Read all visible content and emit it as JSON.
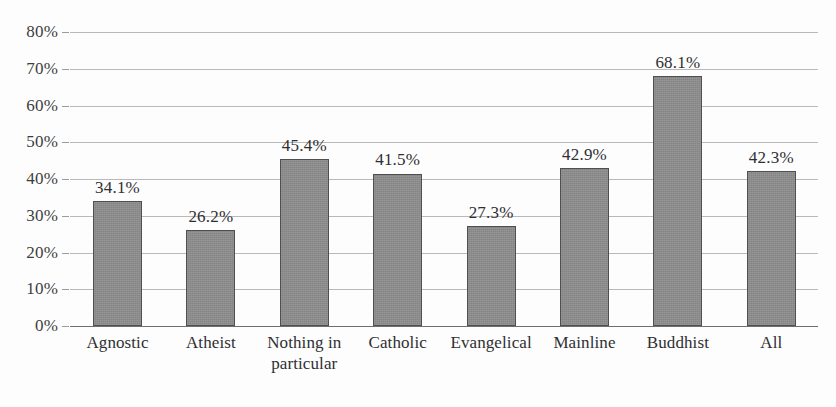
{
  "figure": {
    "background_color": "#fdfdfd",
    "title_fragment": "",
    "bar_color": "#8d8d8d",
    "bar_edge_color": "#4f4f51",
    "gridline_color": "#b9b9bb",
    "axis_color": "#6f6f71",
    "text_color": "#2f2f32"
  },
  "chart_data": {
    "type": "bar",
    "title": "",
    "xlabel": "",
    "ylabel": "",
    "ylim": [
      0,
      80
    ],
    "ytick_labels": [
      "80%",
      "70%",
      "60%",
      "50%",
      "40%",
      "30%",
      "20%",
      "10%",
      "0%"
    ],
    "ytick_values": [
      80,
      70,
      60,
      50,
      40,
      30,
      20,
      10,
      0
    ],
    "grid": true,
    "legend": false,
    "categories": [
      "Agnostic",
      "Atheist",
      "Nothing in particular",
      "Catholic",
      "Evangelical",
      "Mainline",
      "Buddhist",
      "All"
    ],
    "values": [
      34.1,
      26.2,
      45.4,
      41.5,
      27.3,
      42.9,
      68.1,
      42.3
    ],
    "data_labels": [
      "34.1%",
      "26.2%",
      "45.4%",
      "41.5%",
      "27.3%",
      "42.9%",
      "68.1%",
      "42.3%"
    ]
  }
}
